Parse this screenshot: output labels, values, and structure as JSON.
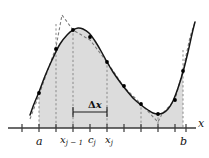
{
  "figure": {
    "axis_label_x": "x",
    "labels": {
      "a": "a",
      "b": "b",
      "x_j_minus_1": "x",
      "x_j_minus_1_sub": "j − 1",
      "c_j": "c",
      "c_j_sub": "j",
      "x_j": "x",
      "x_j_sub": "j",
      "delta_x_symbol": "Δ",
      "delta_x_var": "x"
    },
    "colors": {
      "shade": "#dcdcdc",
      "curve": "#1a1a1a",
      "dashed": "#777777",
      "axis": "#333333",
      "point": "#000000",
      "background": "#ffffff"
    }
  },
  "chart_data": {
    "type": "line",
    "title": "",
    "xlabel": "x",
    "ylabel": "",
    "xlim": [
      0,
      209
    ],
    "ylim": [
      0,
      158
    ],
    "grid": false,
    "legend": null,
    "axis_y_pixel": 128,
    "x_axis_start_px": 8,
    "x_axis_end_px": 196,
    "axis_ticks_px": [
      22,
      39,
      56,
      73,
      90,
      107,
      124,
      141,
      158,
      175,
      186
    ],
    "interval_endpoints": {
      "a_px": 39,
      "b_px": 183
    },
    "marked_points_px": {
      "x_j_minus_1": 73,
      "c_j": 90,
      "x_j": 107
    },
    "delta_x_bracket_px": {
      "x1": 73,
      "x2": 107,
      "y": 112
    },
    "series": [
      {
        "name": "f(x) — smooth curve",
        "style": "solid",
        "points_px": [
          [
            30,
            115
          ],
          [
            34,
            104
          ],
          [
            39,
            92
          ],
          [
            45,
            76
          ],
          [
            52,
            60
          ],
          [
            60,
            44
          ],
          [
            68,
            34
          ],
          [
            73,
            30
          ],
          [
            78,
            28
          ],
          [
            83,
            29
          ],
          [
            89,
            33
          ],
          [
            95,
            41
          ],
          [
            101,
            51
          ],
          [
            107,
            62
          ],
          [
            113,
            72
          ],
          [
            120,
            82
          ],
          [
            127,
            91
          ],
          [
            134,
            99
          ],
          [
            141,
            105
          ],
          [
            148,
            110
          ],
          [
            153,
            113
          ],
          [
            158,
            114
          ],
          [
            163,
            113
          ],
          [
            168,
            109
          ],
          [
            173,
            101
          ],
          [
            178,
            88
          ],
          [
            183,
            72
          ],
          [
            188,
            52
          ],
          [
            192,
            34
          ],
          [
            195,
            22
          ]
        ]
      },
      {
        "name": "polygonal (trapezoid) approximation",
        "style": "dashed",
        "vertices_px": [
          [
            30,
            119
          ],
          [
            39,
            95
          ],
          [
            56,
            47
          ],
          [
            62,
            15
          ],
          [
            73,
            30
          ],
          [
            90,
            40
          ],
          [
            107,
            62
          ],
          [
            124,
            87
          ],
          [
            141,
            104
          ],
          [
            158,
            122
          ],
          [
            162,
            114
          ],
          [
            175,
            100
          ],
          [
            183,
            70
          ],
          [
            190,
            37
          ],
          [
            195,
            22
          ]
        ]
      }
    ],
    "sample_dots_px": [
      [
        39,
        93
      ],
      [
        56,
        49
      ],
      [
        73,
        30
      ],
      [
        90,
        37
      ],
      [
        107,
        62
      ],
      [
        124,
        86
      ],
      [
        141,
        104
      ],
      [
        158,
        114
      ],
      [
        175,
        100
      ],
      [
        183,
        71
      ]
    ],
    "vertical_dashed_lines_px": [
      {
        "x": 39,
        "y_top": 93
      },
      {
        "x": 56,
        "y_top": 24
      },
      {
        "x": 73,
        "y_top": 29
      },
      {
        "x": 107,
        "y_top": 61
      },
      {
        "x": 141,
        "y_top": 103
      },
      {
        "x": 158,
        "y_top": 113
      },
      {
        "x": 183,
        "y_top": 50
      }
    ],
    "shaded_region": {
      "description": "area under curve between a and b",
      "fill": "#dcdcdc"
    },
    "annotations": [
      {
        "text": "a",
        "x_px": 39,
        "y_px": 142,
        "role": "left endpoint"
      },
      {
        "text": "b",
        "x_px": 183,
        "y_px": 142,
        "role": "right endpoint"
      },
      {
        "text": "x_{j-1}",
        "x_px": 73,
        "y_px": 140,
        "role": "subinterval left"
      },
      {
        "text": "c_j",
        "x_px": 90,
        "y_px": 140,
        "role": "sample point"
      },
      {
        "text": "x_j",
        "x_px": 107,
        "y_px": 140,
        "role": "subinterval right"
      },
      {
        "text": "Δx",
        "x_px": 90,
        "y_px": 105,
        "role": "subinterval width"
      },
      {
        "text": "x",
        "x_px": 200,
        "y_px": 123,
        "role": "axis label"
      }
    ]
  }
}
